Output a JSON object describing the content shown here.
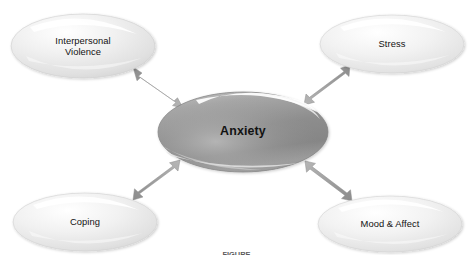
{
  "diagram": {
    "title_text": "Anxiety",
    "center_node": {
      "id": "anxiety",
      "label": "Anxiety",
      "shape": "ellipse",
      "cx": 243,
      "cy": 132,
      "rx": 85,
      "ry": 40,
      "fill_light": "#b9b9b9",
      "fill_mid": "#8f8f8f",
      "fill_dark": "#7a7a7a",
      "text_color": "#111111"
    },
    "satellite_nodes": [
      {
        "id": "interpersonal-violence",
        "label": "Interpersonal\nViolence",
        "shape": "ellipse",
        "cx": 83,
        "cy": 46,
        "rx": 72,
        "ry": 32,
        "fill_light": "#fbfbfb",
        "fill_mid": "#e6e6e6",
        "fill_dark": "#d2d2d2",
        "text_color": "#151515"
      },
      {
        "id": "stress",
        "label": "Stress",
        "shape": "ellipse",
        "cx": 392,
        "cy": 44,
        "rx": 72,
        "ry": 29,
        "fill_light": "#fcfcfc",
        "fill_mid": "#e9e9e9",
        "fill_dark": "#d6d6d6",
        "text_color": "#151515"
      },
      {
        "id": "coping",
        "label": "Coping",
        "shape": "ellipse",
        "cx": 85,
        "cy": 222,
        "rx": 72,
        "ry": 29,
        "fill_light": "#fbfbfb",
        "fill_mid": "#e7e7e7",
        "fill_dark": "#d3d3d3",
        "text_color": "#151515"
      },
      {
        "id": "mood-and-affect",
        "label": "Mood & Affect",
        "shape": "ellipse",
        "cx": 390,
        "cy": 224,
        "rx": 72,
        "ry": 28,
        "fill_light": "#fcfcfc",
        "fill_mid": "#e8e8e8",
        "fill_dark": "#d4d4d4",
        "text_color": "#151515"
      }
    ],
    "connectors": [
      {
        "id": "connector-interpersonal-violence",
        "from": "anxiety",
        "to": "interpersonal-violence",
        "style": "double-headed-arrow",
        "color": "#9a9a9a"
      },
      {
        "id": "connector-stress",
        "from": "anxiety",
        "to": "stress",
        "style": "double-headed-arrow",
        "color": "#9a9a9a"
      },
      {
        "id": "connector-coping",
        "from": "anxiety",
        "to": "coping",
        "style": "double-headed-arrow",
        "color": "#9a9a9a"
      },
      {
        "id": "connector-mood-and-affect",
        "from": "anxiety",
        "to": "mood-and-affect",
        "style": "double-headed-arrow",
        "color": "#9a9a9a"
      }
    ],
    "caption": "FIGURE",
    "background_color": "#ffffff"
  }
}
